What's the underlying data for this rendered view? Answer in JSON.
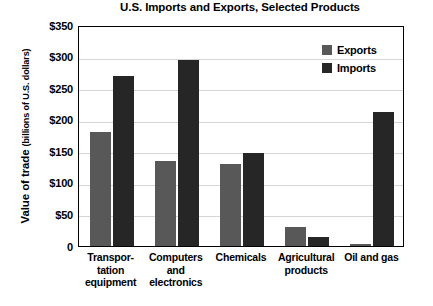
{
  "chart_data": {
    "type": "bar",
    "title": "U.S. Imports and Exports, Selected Products",
    "xlabel": "",
    "ylabel": "Value of trade",
    "ylabel_strong": "Value of trade",
    "ylabel_units": "(billions of U.S. dollars)",
    "ylim": [
      0,
      350
    ],
    "ytick_values": [
      350,
      300,
      250,
      200,
      150,
      100,
      50,
      0
    ],
    "ytick_labels": [
      "$350",
      "$300",
      "$250",
      "$200",
      "$150",
      "$100",
      "$50",
      "0"
    ],
    "grid": true,
    "legend_position": "top-right",
    "categories": [
      "Transpor-\ntation\nequipment",
      "Computers\nand\nelectronics",
      "Chemicals",
      "Agricultural\nproducts",
      "Oil and gas"
    ],
    "categories_plain": [
      "Transportation equipment",
      "Computers and electronics",
      "Chemicals",
      "Agricultural products",
      "Oil and gas"
    ],
    "series": [
      {
        "name": "Exports",
        "color": "#585858",
        "values": [
          180,
          135,
          130,
          30,
          3
        ]
      },
      {
        "name": "Imports",
        "color": "#262626",
        "values": [
          270,
          295,
          147,
          15,
          213
        ]
      }
    ]
  },
  "legend": {
    "items": [
      {
        "label": "Exports",
        "color": "#585858"
      },
      {
        "label": "Imports",
        "color": "#262626"
      }
    ]
  }
}
